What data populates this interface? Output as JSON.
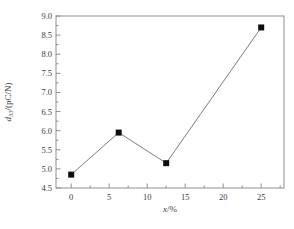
{
  "figure": {
    "background": "#ffffff",
    "frame_color": "#8f8f8f",
    "tick_color": "#8f8f8f",
    "text_color": "#3c3c3c",
    "line_color": "#7d7d7d",
    "marker_color": "#0d0d0d"
  },
  "chart_data": {
    "type": "line",
    "x": [
      0,
      6.25,
      12.5,
      25
    ],
    "y": [
      4.85,
      5.95,
      5.15,
      8.7
    ],
    "series": [
      {
        "name": "d33",
        "marker": "filled-square",
        "x": [
          0,
          6.25,
          12.5,
          25
        ],
        "y": [
          4.85,
          5.95,
          5.15,
          8.7
        ]
      }
    ],
    "title": "",
    "xlabel": "x/%",
    "ylabel": "d33/(pC/N)",
    "xlabel_parts": {
      "symbol": "x",
      "unit": "/%"
    },
    "ylabel_parts": {
      "symbol": "d",
      "subscript": "33",
      "unit": "/(pC/N)"
    },
    "xlim": [
      -2,
      28
    ],
    "ylim": [
      4.5,
      9.0
    ],
    "x_major_ticks": [
      0,
      5,
      10,
      15,
      20,
      25
    ],
    "y_major_ticks": [
      4.5,
      5.0,
      5.5,
      6.0,
      6.5,
      7.0,
      7.5,
      8.0,
      8.5,
      9.0
    ],
    "x_minor_step": 2.5,
    "y_minor_step": 0.25,
    "grid": false,
    "legend": "none",
    "tick_direction": "in"
  }
}
